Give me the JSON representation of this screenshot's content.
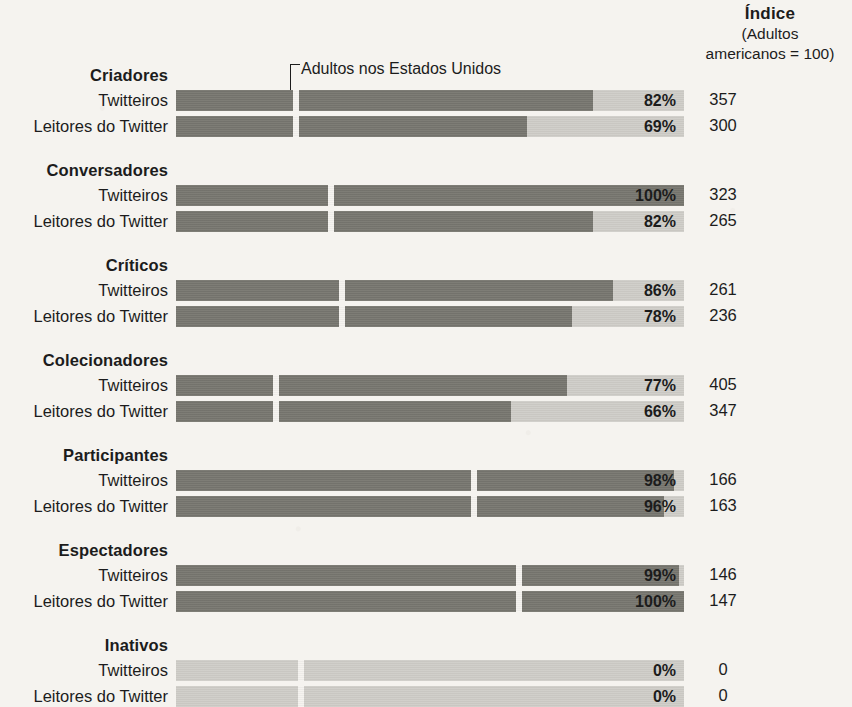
{
  "header": {
    "index_title": "Índice",
    "index_sub_line1": "(Adultos",
    "index_sub_line2": "americanos = 100)"
  },
  "annotation": {
    "label": "Adultos nos Estados Unidos"
  },
  "colors": {
    "background": "#f5f3ef",
    "track": "#cfcdc8",
    "fill": "#77766f",
    "text": "#1c1c1c",
    "marker": "#f5f3ef"
  },
  "chart_data": {
    "type": "bar",
    "title": "",
    "subtitle": "",
    "xlabel": "",
    "ylabel": "",
    "xlim": [
      0,
      100
    ],
    "grid": false,
    "legend": "none",
    "orientation": "horizontal",
    "value_suffix": "%",
    "reference_marker_label": "Adultos nos Estados Unidos",
    "index_column_header": "Índice (Adultos americanos = 100)",
    "series_names": [
      "Twitteiros",
      "Leitores do Twitter"
    ],
    "categories": [
      "Criadores",
      "Conversadores",
      "Críticos",
      "Colecionadores",
      "Participantes",
      "Espectadores",
      "Inativos"
    ],
    "groups": [
      {
        "name": "Criadores",
        "reference_pct": 23,
        "rows": [
          {
            "label": "Twitteiros",
            "pct": 82,
            "pct_text": "82%",
            "index": 357,
            "index_text": "357"
          },
          {
            "label": "Leitores do Twitter",
            "pct": 69,
            "pct_text": "69%",
            "index": 300,
            "index_text": "300"
          }
        ]
      },
      {
        "name": "Conversadores",
        "reference_pct": 30,
        "rows": [
          {
            "label": "Twitteiros",
            "pct": 100,
            "pct_text": "100%",
            "index": 323,
            "index_text": "323"
          },
          {
            "label": "Leitores do Twitter",
            "pct": 82,
            "pct_text": "82%",
            "index": 265,
            "index_text": "265"
          }
        ]
      },
      {
        "name": "Críticos",
        "reference_pct": 32,
        "rows": [
          {
            "label": "Twitteiros",
            "pct": 86,
            "pct_text": "86%",
            "index": 261,
            "index_text": "261"
          },
          {
            "label": "Leitores do Twitter",
            "pct": 78,
            "pct_text": "78%",
            "index": 236,
            "index_text": "236"
          }
        ]
      },
      {
        "name": "Colecionadores",
        "reference_pct": 19,
        "rows": [
          {
            "label": "Twitteiros",
            "pct": 77,
            "pct_text": "77%",
            "index": 405,
            "index_text": "405"
          },
          {
            "label": "Leitores do Twitter",
            "pct": 66,
            "pct_text": "66%",
            "index": 347,
            "index_text": "347"
          }
        ]
      },
      {
        "name": "Participantes",
        "reference_pct": 58,
        "rows": [
          {
            "label": "Twitteiros",
            "pct": 98,
            "pct_text": "98%",
            "index": 166,
            "index_text": "166"
          },
          {
            "label": "Leitores do Twitter",
            "pct": 96,
            "pct_text": "96%",
            "index": 163,
            "index_text": "163"
          }
        ]
      },
      {
        "name": "Espectadores",
        "reference_pct": 67,
        "rows": [
          {
            "label": "Twitteiros",
            "pct": 99,
            "pct_text": "99%",
            "index": 146,
            "index_text": "146"
          },
          {
            "label": "Leitores do Twitter",
            "pct": 100,
            "pct_text": "100%",
            "index": 147,
            "index_text": "147"
          }
        ]
      },
      {
        "name": "Inativos",
        "reference_pct": 24,
        "rows": [
          {
            "label": "Twitteiros",
            "pct": 0,
            "pct_text": "0%",
            "index": 0,
            "index_text": "0"
          },
          {
            "label": "Leitores do Twitter",
            "pct": 0,
            "pct_text": "0%",
            "index": 0,
            "index_text": "0"
          }
        ]
      }
    ]
  }
}
